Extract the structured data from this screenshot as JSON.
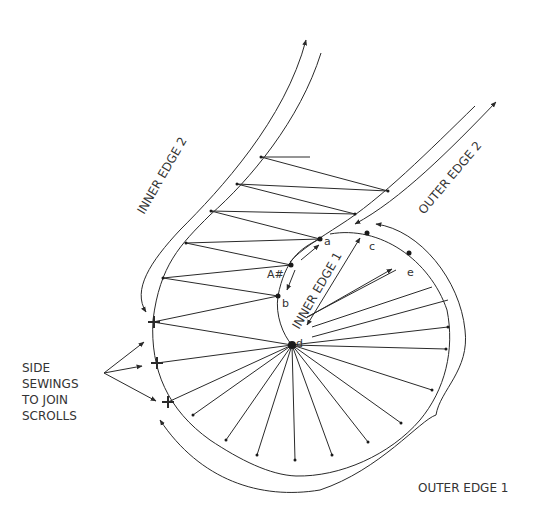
{
  "labels": {
    "inner_edge_2": "INNER EDGE 2",
    "outer_edge_2": "OUTER EDGE 2",
    "inner_edge_1": "INNER EDGE 1",
    "outer_edge_1": "OUTER EDGE 1",
    "side_sewings": [
      "SIDE",
      "SEWINGS",
      "TO JOIN",
      "SCROLLS"
    ]
  },
  "points": {
    "a": "a",
    "A": "A#",
    "b": "b",
    "c": "c",
    "d": "d",
    "e": "e"
  },
  "colors": {
    "line": "#2a2a2a",
    "text": "#333333",
    "background": "#ffffff"
  }
}
